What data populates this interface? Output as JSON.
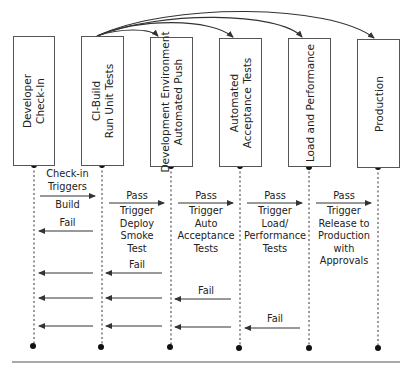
{
  "stages": [
    {
      "id": "dev",
      "label": "Developer\nCheck-In"
    },
    {
      "id": "ci",
      "label": "CI-Build\nRun Unit Tests"
    },
    {
      "id": "devenv",
      "label": "Development Environment\nAutomated Push"
    },
    {
      "id": "accept",
      "label": "Automated\nAcceptance Tests"
    },
    {
      "id": "load",
      "label": "Load and Performance"
    },
    {
      "id": "prod",
      "label": "Production"
    }
  ],
  "messages": {
    "checkin": "Check-in\nTriggers",
    "build": "Build",
    "fail1": "Fail",
    "pass1": "Pass",
    "deploy": "Trigger\nDeploy\nSmoke\nTest",
    "fail2": "Fail",
    "pass2": "Pass",
    "auto": "Trigger\nAuto\nAcceptance\nTests",
    "fail3": "Fail",
    "pass3": "Pass",
    "loadperf": "Trigger\nLoad/\nPerformance\nTests",
    "fail4": "Fail",
    "pass4": "Pass",
    "release": "Trigger\nRelease to\nProduction\nwith\nApprovals"
  },
  "colors": {
    "line": "#333333",
    "box_border": "#555555"
  }
}
